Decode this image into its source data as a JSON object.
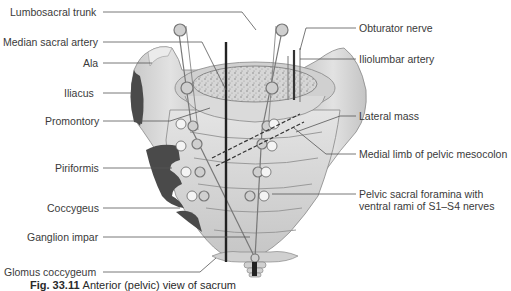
{
  "figure": {
    "caption": "Fig. 33.11",
    "caption_rest": "Anterior (pelvic) view of sacrum",
    "colors": {
      "bone": "#d4d4d4",
      "bone_light": "#e6e6e6",
      "bone_shadow": "#b8b8b8",
      "muscle": "#4a4a4a",
      "leader_line": "#555555",
      "text": "#3a3a3a",
      "background": "#ffffff"
    }
  },
  "labels_left": [
    {
      "id": "lumbosacral-trunk",
      "text": "Lumbosacral trunk"
    },
    {
      "id": "median-sacral-artery",
      "text": "Median sacral artery"
    },
    {
      "id": "ala",
      "text": "Ala"
    },
    {
      "id": "iliacus",
      "text": "Iliacus"
    },
    {
      "id": "promontory",
      "text": "Promontory"
    },
    {
      "id": "piriformis",
      "text": "Piriformis"
    },
    {
      "id": "coccygeus",
      "text": "Coccygeus"
    },
    {
      "id": "ganglion-impar",
      "text": "Ganglion impar"
    },
    {
      "id": "glomus-coccygeum",
      "text": "Glomus coccygeum"
    }
  ],
  "labels_right": [
    {
      "id": "obturator-nerve",
      "text": "Obturator nerve"
    },
    {
      "id": "iliolumbar-artery",
      "text": "Iliolumbar artery"
    },
    {
      "id": "lateral-mass",
      "text": "Lateral mass"
    },
    {
      "id": "medial-limb-pelvic-mesocolon",
      "text": "Medial limb of pelvic mesocolon"
    },
    {
      "id": "pelvic-sacral-foramina-line1",
      "text": "Pelvic sacral foramina with"
    },
    {
      "id": "pelvic-sacral-foramina-line2",
      "text": "ventral rami of S1–S4 nerves"
    }
  ]
}
